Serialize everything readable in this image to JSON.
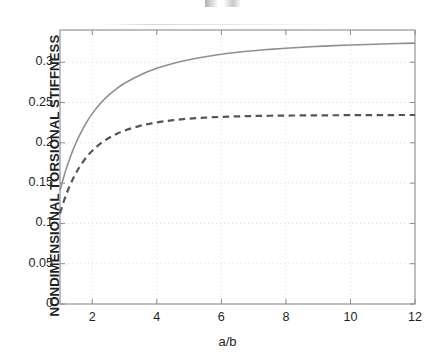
{
  "figure": {
    "background": "#ffffff",
    "axis_color": "#8a8a8a",
    "grid_color": "#d9d9d9",
    "text_color": "#1f1f1f"
  },
  "chart_data": {
    "type": "line",
    "title": "",
    "xlabel": "a/b",
    "ylabel": "NONDIMENSIONAL TORSIONAL STIFFNESS",
    "xlim": [
      1,
      12
    ],
    "ylim": [
      0,
      0.34
    ],
    "grid": true,
    "grid_style": "dotted",
    "legend": null,
    "xticks": [
      2,
      4,
      6,
      8,
      10,
      12
    ],
    "xticklabels": [
      "2",
      "4",
      "6",
      "8",
      "10",
      "12"
    ],
    "yticks": [
      0,
      0.05,
      0.1,
      0.15,
      0.2,
      0.25,
      0.3
    ],
    "yticklabels": [
      "0",
      "0.05",
      "0.1",
      "0.15",
      "0.2",
      "0.25",
      "0.3"
    ],
    "x": [
      1,
      1.1,
      1.2,
      1.3,
      1.4,
      1.5,
      1.6,
      1.8,
      2,
      2.25,
      2.5,
      2.75,
      3,
      3.5,
      4,
      4.5,
      5,
      5.5,
      6,
      6.5,
      7,
      7.5,
      8,
      8.5,
      9,
      9.5,
      10,
      10.5,
      11,
      11.5,
      12
    ],
    "series": [
      {
        "name": "solid-curve",
        "style": "solid",
        "color": "#8f8f8f",
        "linewidth": 1.6,
        "values": [
          0.1406,
          0.1554,
          0.1686,
          0.1803,
          0.1909,
          0.2004,
          0.209,
          0.2239,
          0.2362,
          0.2487,
          0.2588,
          0.267,
          0.2739,
          0.2846,
          0.2925,
          0.2985,
          0.3032,
          0.3069,
          0.3099,
          0.3123,
          0.3143,
          0.316,
          0.3174,
          0.3186,
          0.3197,
          0.3206,
          0.3214,
          0.3221,
          0.3227,
          0.3232,
          0.3237
        ]
      },
      {
        "name": "dashed-curve",
        "style": "dashed",
        "color": "#555555",
        "linewidth": 2.2,
        "values": [
          0.1124,
          0.1253,
          0.1366,
          0.1465,
          0.1552,
          0.1629,
          0.1697,
          0.1811,
          0.1901,
          0.1989,
          0.2057,
          0.211,
          0.2152,
          0.2213,
          0.2254,
          0.2281,
          0.23,
          0.2313,
          0.2322,
          0.2328,
          0.2333,
          0.2336,
          0.2338,
          0.234,
          0.2341,
          0.2342,
          0.2343,
          0.2344,
          0.2344,
          0.2345,
          0.2345
        ]
      }
    ]
  }
}
